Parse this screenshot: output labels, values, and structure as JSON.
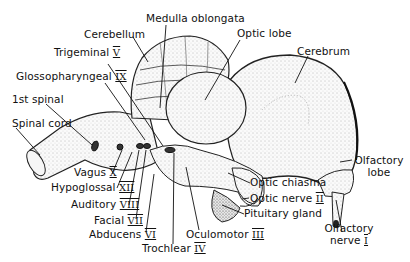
{
  "diagram": {
    "labels": [
      {
        "id": "medulla-oblongata",
        "text": "Medulla oblongata",
        "numeral": ""
      },
      {
        "id": "cerebellum",
        "text": "Cerebellum",
        "numeral": ""
      },
      {
        "id": "optic-lobe",
        "text": "Optic lobe",
        "numeral": ""
      },
      {
        "id": "cerebrum",
        "text": "Cerebrum",
        "numeral": ""
      },
      {
        "id": "trigeminal",
        "text": "Trigeminal",
        "numeral": "V"
      },
      {
        "id": "glossopharyngeal",
        "text": "Glossopharyngeal",
        "numeral": "IX"
      },
      {
        "id": "first-spinal",
        "text": "1st spinal",
        "numeral": ""
      },
      {
        "id": "spinal-cord",
        "text": "Spinal cord",
        "numeral": ""
      },
      {
        "id": "vagus",
        "text": "Vagus",
        "numeral": "X"
      },
      {
        "id": "hypoglossal",
        "text": "Hypoglossal",
        "numeral": "XII"
      },
      {
        "id": "auditory",
        "text": "Auditory",
        "numeral": "VIII"
      },
      {
        "id": "facial",
        "text": "Facial",
        "numeral": "VII"
      },
      {
        "id": "abducens",
        "text": "Abducens",
        "numeral": "VI"
      },
      {
        "id": "trochlear",
        "text": "Trochlear",
        "numeral": "IV"
      },
      {
        "id": "oculomotor",
        "text": "Oculomotor",
        "numeral": "III"
      },
      {
        "id": "optic-chiasma",
        "text": "Optic chiasma",
        "numeral": ""
      },
      {
        "id": "optic-nerve",
        "text": "Optic nerve",
        "numeral": "II"
      },
      {
        "id": "pituitary-gland",
        "text": "Pituitary gland",
        "numeral": ""
      },
      {
        "id": "olfactory-lobe",
        "text": "Olfactory lobe",
        "line1": "Olfactory",
        "line2": "lobe",
        "numeral": ""
      },
      {
        "id": "olfactory-nerve",
        "text": "Olfactory nerve I",
        "line1": "Olfactory",
        "line2": "nerve",
        "numeral": "I"
      }
    ]
  }
}
